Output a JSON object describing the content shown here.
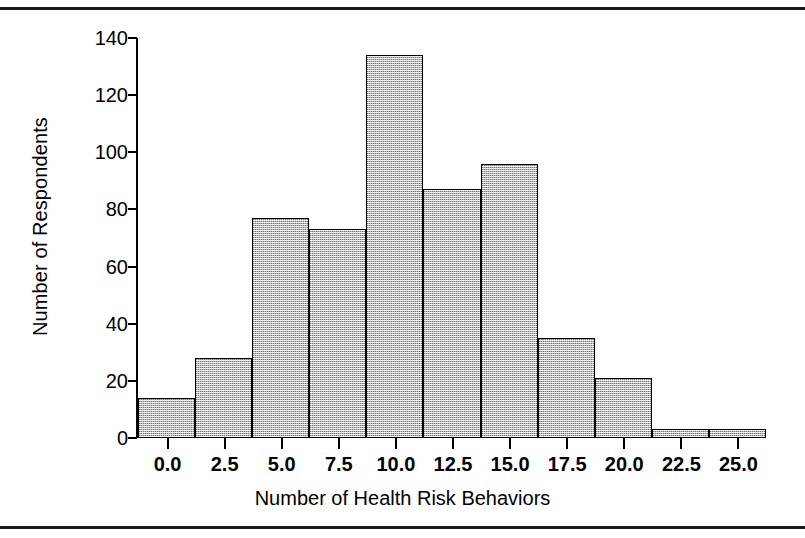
{
  "figure": {
    "top_rule": "",
    "bottom_rule": ""
  },
  "chart_data": {
    "type": "bar",
    "title": "",
    "xlabel": "Number of Health Risk Behaviors",
    "ylabel": "Number of Respondents",
    "xlim": [
      -1.25,
      26.25
    ],
    "ylim": [
      0,
      140
    ],
    "grid": false,
    "legend": null,
    "bin_width": 2.5,
    "categories": [
      "0.0",
      "2.5",
      "5.0",
      "7.5",
      "10.0",
      "12.5",
      "15.0",
      "17.5",
      "20.0",
      "22.5",
      "25.0"
    ],
    "bin_centers": [
      0.0,
      2.5,
      5.0,
      7.5,
      10.0,
      12.5,
      15.0,
      17.5,
      20.0,
      22.5,
      25.0
    ],
    "values": [
      14,
      28,
      77,
      73,
      134,
      87,
      96,
      35,
      21,
      3,
      3
    ],
    "y_ticks": [
      "0",
      "20",
      "40",
      "60",
      "80",
      "100",
      "120",
      "140"
    ],
    "y_tick_values": [
      0,
      20,
      40,
      60,
      80,
      100,
      120,
      140
    ],
    "x_ticks": [
      "0.0",
      "2.5",
      "5.0",
      "7.5",
      "10.0",
      "12.5",
      "15.0",
      "17.5",
      "20.0",
      "22.5",
      "25.0"
    ],
    "x_tick_values": [
      0.0,
      2.5,
      5.0,
      7.5,
      10.0,
      12.5,
      15.0,
      17.5,
      20.0,
      22.5,
      25.0
    ],
    "bar_fill_color": "#b9b9b9",
    "bar_edge_color": "#000000",
    "background_color": "#ffffff"
  }
}
